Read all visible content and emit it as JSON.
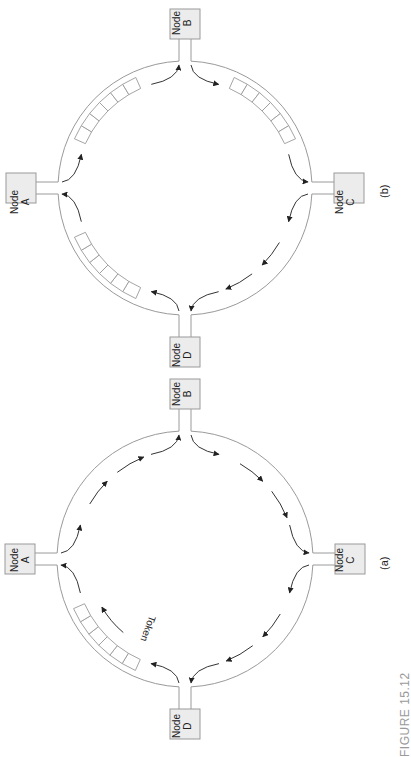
{
  "figure": {
    "caption": "FIGURE 15.12",
    "colors": {
      "ring": "#9a9a9a",
      "node_fill": "#ececec",
      "arrow": "#333333",
      "caption": "#9a9a9a"
    }
  },
  "panels": [
    {
      "id": "b",
      "label": "(b)",
      "center": [
        185,
        188
      ],
      "radius": 127,
      "nodes": [
        {
          "name": "Node",
          "letter": "B",
          "pos": "top"
        },
        {
          "name": "Node",
          "letter": "A",
          "pos": "left"
        },
        {
          "name": "Node",
          "letter": "C",
          "pos": "right"
        },
        {
          "name": "Node",
          "letter": "D",
          "pos": "bottom"
        }
      ],
      "buffers": [
        "A-B",
        "B-C",
        "D-A"
      ],
      "token": null
    },
    {
      "id": "a",
      "label": "(a)",
      "center": [
        185,
        559
      ],
      "radius": 128,
      "nodes": [
        {
          "name": "Node",
          "letter": "B",
          "pos": "top"
        },
        {
          "name": "Node",
          "letter": "A",
          "pos": "left"
        },
        {
          "name": "Node",
          "letter": "C",
          "pos": "right"
        },
        {
          "name": "Node",
          "letter": "D",
          "pos": "bottom"
        }
      ],
      "buffers": [
        "D-A"
      ],
      "token": {
        "label": "Token",
        "segment": "D-A"
      }
    }
  ]
}
